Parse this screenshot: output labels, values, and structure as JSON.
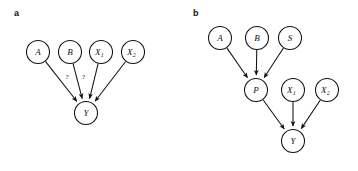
{
  "figure": {
    "width": 358,
    "height": 171,
    "background": "#ffffff",
    "ink": "#111111"
  },
  "panels": [
    {
      "id": "panel-a",
      "label": "a",
      "label_x": 14,
      "label_y": 16,
      "nodes": [
        {
          "id": "a-A",
          "label": "A",
          "sub": "",
          "cx": 38,
          "cy": 52,
          "r": 11.5
        },
        {
          "id": "a-B",
          "label": "B",
          "sub": "",
          "cx": 70,
          "cy": 52,
          "r": 11.5
        },
        {
          "id": "a-X1",
          "label": "X",
          "sub": "1",
          "cx": 101,
          "cy": 52,
          "r": 11.5
        },
        {
          "id": "a-X2",
          "label": "X",
          "sub": "2",
          "cx": 133,
          "cy": 52,
          "r": 11.5
        },
        {
          "id": "a-Y",
          "label": "Y",
          "sub": "",
          "cx": 86,
          "cy": 113,
          "r": 11.5
        }
      ],
      "edges": [
        {
          "id": "a-A-Y",
          "from": "a-A",
          "to": "a-Y",
          "label": "?",
          "label_dx": 6,
          "label_dy": -2
        },
        {
          "id": "a-B-Y",
          "from": "a-B",
          "to": "a-Y",
          "label": "?",
          "label_dx": 6,
          "label_dy": -2
        },
        {
          "id": "a-X1-Y",
          "from": "a-X1",
          "to": "a-Y",
          "label": "",
          "label_dx": 0,
          "label_dy": 0
        },
        {
          "id": "a-X2-Y",
          "from": "a-X2",
          "to": "a-Y",
          "label": "",
          "label_dx": 0,
          "label_dy": 0
        }
      ]
    },
    {
      "id": "panel-b",
      "label": "b",
      "label_x": 193,
      "label_y": 16,
      "nodes": [
        {
          "id": "b-A",
          "label": "A",
          "sub": "",
          "cx": 220,
          "cy": 38,
          "r": 11.5
        },
        {
          "id": "b-B",
          "label": "B",
          "sub": "",
          "cx": 257,
          "cy": 38,
          "r": 11.5
        },
        {
          "id": "b-S",
          "label": "S",
          "sub": "",
          "cx": 290,
          "cy": 38,
          "r": 11.5
        },
        {
          "id": "b-P",
          "label": "P",
          "sub": "",
          "cx": 256,
          "cy": 90,
          "r": 11.5
        },
        {
          "id": "b-X1",
          "label": "X",
          "sub": "1",
          "cx": 293,
          "cy": 90,
          "r": 11.5
        },
        {
          "id": "b-X2",
          "label": "X",
          "sub": "2",
          "cx": 327,
          "cy": 90,
          "r": 11.5
        },
        {
          "id": "b-Y",
          "label": "Y",
          "sub": "",
          "cx": 293,
          "cy": 141,
          "r": 11.5
        }
      ],
      "edges": [
        {
          "id": "b-A-P",
          "from": "b-A",
          "to": "b-P",
          "label": "",
          "label_dx": 0,
          "label_dy": 0
        },
        {
          "id": "b-B-P",
          "from": "b-B",
          "to": "b-P",
          "label": "",
          "label_dx": 0,
          "label_dy": 0
        },
        {
          "id": "b-S-P",
          "from": "b-S",
          "to": "b-P",
          "label": "",
          "label_dx": 0,
          "label_dy": 0
        },
        {
          "id": "b-P-Y",
          "from": "b-P",
          "to": "b-Y",
          "label": "",
          "label_dx": 0,
          "label_dy": 0
        },
        {
          "id": "b-X1-Y",
          "from": "b-X1",
          "to": "b-Y",
          "label": "",
          "label_dx": 0,
          "label_dy": 0
        },
        {
          "id": "b-X2-Y",
          "from": "b-X2",
          "to": "b-Y",
          "label": "",
          "label_dx": 0,
          "label_dy": 0
        }
      ]
    }
  ]
}
